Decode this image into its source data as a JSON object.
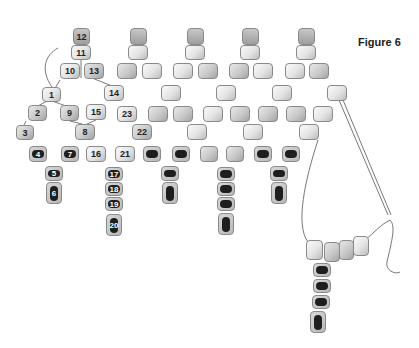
{
  "figure": {
    "title": "Figure 6",
    "colors": {
      "light_bead": "#e4e4e4",
      "mid_bead": "#c9c9c9",
      "dark_core": "#1e1e1e",
      "thread": "#555555",
      "background": "#ffffff"
    }
  },
  "beads": [
    {
      "label": "12",
      "x": 73,
      "y": 28,
      "w": 17,
      "h": 17,
      "type": "top"
    },
    {
      "label": "11",
      "x": 71,
      "y": 45,
      "w": 20,
      "h": 15,
      "type": "light"
    },
    {
      "label": "10",
      "x": 60,
      "y": 63,
      "w": 20,
      "h": 16,
      "type": "light"
    },
    {
      "label": "13",
      "x": 84,
      "y": 63,
      "w": 20,
      "h": 16,
      "type": "mid"
    },
    {
      "label": "1",
      "x": 42,
      "y": 87,
      "w": 19,
      "h": 15,
      "type": "light"
    },
    {
      "label": "14",
      "x": 104,
      "y": 85,
      "w": 20,
      "h": 16,
      "type": "light"
    },
    {
      "label": "2",
      "x": 28,
      "y": 105,
      "w": 19,
      "h": 16,
      "type": "mid"
    },
    {
      "label": "9",
      "x": 60,
      "y": 105,
      "w": 19,
      "h": 16,
      "type": "mid"
    },
    {
      "label": "15",
      "x": 86,
      "y": 104,
      "w": 20,
      "h": 16,
      "type": "light"
    },
    {
      "label": "23",
      "x": 117,
      "y": 106,
      "w": 20,
      "h": 16,
      "type": "light"
    },
    {
      "label": "3",
      "x": 16,
      "y": 125,
      "w": 18,
      "h": 15,
      "type": "mid"
    },
    {
      "label": "8",
      "x": 75,
      "y": 124,
      "w": 20,
      "h": 16,
      "type": "mid"
    },
    {
      "label": "22",
      "x": 132,
      "y": 124,
      "w": 20,
      "h": 16,
      "type": "mid"
    },
    {
      "label": "4",
      "x": 29,
      "y": 146,
      "w": 18,
      "h": 16,
      "type": "dark"
    },
    {
      "label": "7",
      "x": 61,
      "y": 146,
      "w": 18,
      "h": 16,
      "type": "dark"
    },
    {
      "label": "16",
      "x": 86,
      "y": 146,
      "w": 20,
      "h": 16,
      "type": "light"
    },
    {
      "label": "21",
      "x": 115,
      "y": 146,
      "w": 20,
      "h": 16,
      "type": "light"
    },
    {
      "label": "5",
      "x": 45,
      "y": 166,
      "w": 18,
      "h": 15,
      "type": "dark"
    },
    {
      "label": "6",
      "x": 46,
      "y": 182,
      "w": 16,
      "h": 22,
      "type": "dark drop"
    },
    {
      "label": "17",
      "x": 105,
      "y": 167,
      "w": 18,
      "h": 14,
      "type": "dark"
    },
    {
      "label": "18",
      "x": 105,
      "y": 182,
      "w": 18,
      "h": 14,
      "type": "dark"
    },
    {
      "label": "19",
      "x": 105,
      "y": 197,
      "w": 18,
      "h": 14,
      "type": "dark"
    },
    {
      "label": "20",
      "x": 106,
      "y": 214,
      "w": 16,
      "h": 22,
      "type": "dark drop"
    }
  ],
  "unlabeled_beads": [
    {
      "x": 130,
      "y": 28,
      "w": 17,
      "h": 17,
      "type": "top"
    },
    {
      "x": 128,
      "y": 45,
      "w": 20,
      "h": 15,
      "type": "light"
    },
    {
      "x": 117,
      "y": 63,
      "w": 20,
      "h": 16,
      "type": "mid"
    },
    {
      "x": 142,
      "y": 63,
      "w": 20,
      "h": 16,
      "type": "light"
    },
    {
      "x": 161,
      "y": 85,
      "w": 20,
      "h": 16,
      "type": "light"
    },
    {
      "x": 148,
      "y": 106,
      "w": 20,
      "h": 16,
      "type": "mid"
    },
    {
      "x": 173,
      "y": 106,
      "w": 20,
      "h": 16,
      "type": "mid"
    },
    {
      "x": 187,
      "y": 124,
      "w": 20,
      "h": 16,
      "type": "light"
    },
    {
      "x": 143,
      "y": 146,
      "w": 18,
      "h": 16,
      "type": "dark"
    },
    {
      "x": 172,
      "y": 146,
      "w": 18,
      "h": 16,
      "type": "dark"
    },
    {
      "x": 161,
      "y": 166,
      "w": 18,
      "h": 15,
      "type": "dark"
    },
    {
      "x": 162,
      "y": 182,
      "w": 16,
      "h": 22,
      "type": "dark drop"
    },
    {
      "x": 187,
      "y": 28,
      "w": 17,
      "h": 17,
      "type": "top"
    },
    {
      "x": 185,
      "y": 45,
      "w": 20,
      "h": 15,
      "type": "light"
    },
    {
      "x": 173,
      "y": 63,
      "w": 20,
      "h": 16,
      "type": "light"
    },
    {
      "x": 198,
      "y": 63,
      "w": 20,
      "h": 16,
      "type": "mid"
    },
    {
      "x": 216,
      "y": 85,
      "w": 20,
      "h": 16,
      "type": "light"
    },
    {
      "x": 203,
      "y": 106,
      "w": 20,
      "h": 16,
      "type": "light"
    },
    {
      "x": 230,
      "y": 106,
      "w": 20,
      "h": 16,
      "type": "mid"
    },
    {
      "x": 243,
      "y": 124,
      "w": 20,
      "h": 16,
      "type": "light"
    },
    {
      "x": 200,
      "y": 146,
      "w": 18,
      "h": 16,
      "type": "mid"
    },
    {
      "x": 226,
      "y": 146,
      "w": 18,
      "h": 16,
      "type": "mid"
    },
    {
      "x": 217,
      "y": 167,
      "w": 18,
      "h": 14,
      "type": "dark"
    },
    {
      "x": 217,
      "y": 182,
      "w": 18,
      "h": 14,
      "type": "dark"
    },
    {
      "x": 217,
      "y": 197,
      "w": 18,
      "h": 14,
      "type": "dark"
    },
    {
      "x": 218,
      "y": 213,
      "w": 16,
      "h": 22,
      "type": "dark drop"
    },
    {
      "x": 242,
      "y": 28,
      "w": 17,
      "h": 17,
      "type": "top"
    },
    {
      "x": 240,
      "y": 45,
      "w": 20,
      "h": 15,
      "type": "light"
    },
    {
      "x": 229,
      "y": 63,
      "w": 20,
      "h": 16,
      "type": "mid"
    },
    {
      "x": 253,
      "y": 63,
      "w": 20,
      "h": 16,
      "type": "light"
    },
    {
      "x": 272,
      "y": 85,
      "w": 20,
      "h": 16,
      "type": "light"
    },
    {
      "x": 258,
      "y": 106,
      "w": 20,
      "h": 16,
      "type": "mid"
    },
    {
      "x": 286,
      "y": 106,
      "w": 20,
      "h": 16,
      "type": "mid"
    },
    {
      "x": 299,
      "y": 124,
      "w": 20,
      "h": 16,
      "type": "light"
    },
    {
      "x": 254,
      "y": 146,
      "w": 18,
      "h": 16,
      "type": "dark"
    },
    {
      "x": 282,
      "y": 146,
      "w": 18,
      "h": 16,
      "type": "dark"
    },
    {
      "x": 270,
      "y": 166,
      "w": 18,
      "h": 15,
      "type": "dark"
    },
    {
      "x": 271,
      "y": 182,
      "w": 16,
      "h": 22,
      "type": "dark drop"
    },
    {
      "x": 298,
      "y": 28,
      "w": 17,
      "h": 17,
      "type": "top"
    },
    {
      "x": 296,
      "y": 45,
      "w": 20,
      "h": 15,
      "type": "light"
    },
    {
      "x": 285,
      "y": 63,
      "w": 20,
      "h": 16,
      "type": "light"
    },
    {
      "x": 309,
      "y": 63,
      "w": 20,
      "h": 16,
      "type": "mid"
    },
    {
      "x": 327,
      "y": 85,
      "w": 20,
      "h": 16,
      "type": "light"
    },
    {
      "x": 313,
      "y": 106,
      "w": 20,
      "h": 16,
      "type": "light"
    },
    {
      "x": 306,
      "y": 240,
      "w": 17,
      "h": 20,
      "type": "light"
    },
    {
      "x": 324,
      "y": 242,
      "w": 16,
      "h": 20,
      "type": "mid"
    },
    {
      "x": 339,
      "y": 240,
      "w": 15,
      "h": 20,
      "type": "mid"
    },
    {
      "x": 353,
      "y": 236,
      "w": 16,
      "h": 20,
      "type": "light"
    },
    {
      "x": 313,
      "y": 263,
      "w": 18,
      "h": 14,
      "type": "dark"
    },
    {
      "x": 313,
      "y": 279,
      "w": 18,
      "h": 14,
      "type": "dark"
    },
    {
      "x": 312,
      "y": 295,
      "w": 18,
      "h": 14,
      "type": "dark"
    },
    {
      "x": 310,
      "y": 311,
      "w": 16,
      "h": 22,
      "type": "dark drop"
    }
  ],
  "threads": [
    "M52,87 C40,70 45,55 58,48",
    "M339,100 L388,215",
    "M343,100 L391,215",
    "M318,140 C305,180 295,225 308,242",
    "M365,240 C375,232 380,225 390,220 C396,226 392,240 387,262 C385,270 395,275 400,272",
    "M51,95 L60,80 M81,78 L81,60 M92,78 L112,86",
    "M47,101 L38,106 M52,101 L66,106",
    "M26,121 L24,125 M70,121 L82,124 M96,120 L87,124"
  ]
}
